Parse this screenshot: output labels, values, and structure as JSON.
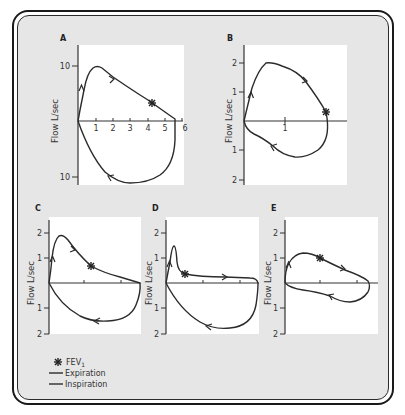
{
  "figure": {
    "panels": [
      {
        "id": "A",
        "label": "A",
        "ylabel": "Flow L/sec",
        "y_ticks": [
          "10",
          "10"
        ],
        "x_ticks": [
          "1",
          "2",
          "3",
          "4",
          "5",
          "6"
        ]
      },
      {
        "id": "B",
        "label": "B",
        "ylabel": "Flow L/sec",
        "y_ticks": [
          "2",
          "1",
          "1",
          "2"
        ],
        "x_ticks": [
          "1"
        ]
      },
      {
        "id": "C",
        "label": "C",
        "ylabel": "Flow L/sec",
        "y_ticks": [
          "2",
          "1",
          "1",
          "2"
        ]
      },
      {
        "id": "D",
        "label": "D",
        "ylabel": "Flow L/sec",
        "y_ticks": [
          "2",
          "1",
          "1",
          "2"
        ]
      },
      {
        "id": "E",
        "label": "E",
        "ylabel": "Flow L/sec",
        "y_ticks": [
          "2",
          "1",
          "1",
          "2"
        ]
      }
    ],
    "legend": {
      "fev1": "FEV",
      "fev1_sub": "1",
      "expiration": "Expiration",
      "inspiration": "Inspiration"
    }
  },
  "colors": {
    "frame_bg": "#e6e6e6",
    "plot_bg": "#ffffff",
    "line": "#2b2b2b"
  }
}
